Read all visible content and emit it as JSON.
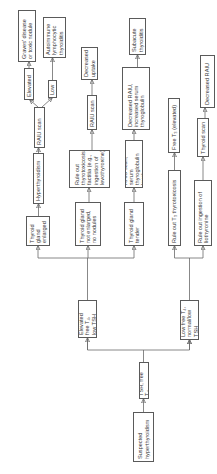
{
  "diagram": {
    "type": "flowchart",
    "orientation": "rotated -90deg (reads bottom-to-top)",
    "nodes": {
      "start": "Suspected\nhyperthyroidism",
      "test": "TSH, free T₄",
      "elevated_t4": "Elevated free T₄,\nlow TSH",
      "low_t4": "Low free T₄,\nnormal/low TSH",
      "gland_enlarged": "Thyroid\ngland\nenlarged",
      "gland_not_enlarged": "Thyroid gland\nnot enlarged,\nno nodules",
      "gland_tender": "Thyroid gland\ntender",
      "hyperthyroidism": "Hyperthyroidism",
      "rule_out_factitia": "Rule out\nthyrotoxicosis\nfactitia (e.g.,\ningestion of\nlevothyroxine)",
      "raiu_thyroglobulin": "RAIU scan, serum\nthyroglobulin level",
      "rule_out_t3": "Rule out T₃ thyrotoxicosis",
      "rule_out_liothyronine": "Rule out ingestion of\nliothyronine",
      "raiu_scan_1": "RAIU scan",
      "elevated": "Elevated",
      "low": "Low",
      "graves": "Graves’ disease\nor toxic nodule",
      "autoimmune": "Autoimmune\nlymphocytic\nthyroiditis",
      "raiu_scan_2": "RAIU scan",
      "decreased_uptake": "Decreased\nuptake",
      "decreased_raiu_tg": "Decreased RAIU,\nincreased serum\nthyroglobulin",
      "subacute": "Subacute\nthyroiditis",
      "free_t3": "Free T₃ (elevated)",
      "thyroid_scan": "Thyroid scan",
      "decreased_raiu": "Decreased RAIU"
    },
    "edges": [
      [
        "start",
        "test"
      ],
      [
        "test",
        "elevated_t4"
      ],
      [
        "test",
        "low_t4"
      ],
      [
        "elevated_t4",
        "gland_enlarged"
      ],
      [
        "elevated_t4",
        "gland_not_enlarged"
      ],
      [
        "elevated_t4",
        "gland_tender"
      ],
      [
        "gland_enlarged",
        "hyperthyroidism"
      ],
      [
        "hyperthyroidism",
        "raiu_scan_1"
      ],
      [
        "raiu_scan_1",
        "elevated"
      ],
      [
        "raiu_scan_1",
        "low"
      ],
      [
        "elevated",
        "graves"
      ],
      [
        "low",
        "autoimmune"
      ],
      [
        "gland_not_enlarged",
        "rule_out_factitia"
      ],
      [
        "rule_out_factitia",
        "raiu_scan_2"
      ],
      [
        "raiu_scan_2",
        "decreased_uptake"
      ],
      [
        "gland_tender",
        "raiu_thyroglobulin"
      ],
      [
        "raiu_thyroglobulin",
        "decreased_raiu_tg"
      ],
      [
        "decreased_raiu_tg",
        "subacute"
      ],
      [
        "low_t4",
        "rule_out_t3"
      ],
      [
        "low_t4",
        "rule_out_liothyronine"
      ],
      [
        "rule_out_t3",
        "free_t3"
      ],
      [
        "rule_out_liothyronine",
        "thyroid_scan"
      ],
      [
        "thyroid_scan",
        "decreased_raiu"
      ]
    ]
  }
}
